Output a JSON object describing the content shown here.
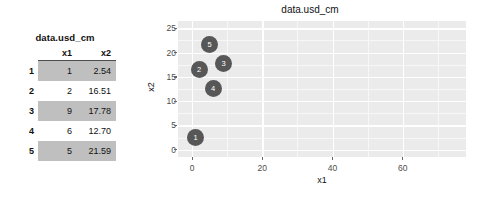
{
  "table": {
    "caption": "data.usd_cm",
    "columns": [
      "x1",
      "x2"
    ],
    "rownames": [
      "1",
      "2",
      "3",
      "4",
      "5"
    ],
    "rows": [
      {
        "name": "1",
        "x1": "1",
        "x2": "2.54",
        "shaded": true
      },
      {
        "name": "2",
        "x1": "2",
        "x2": "16.51",
        "shaded": false
      },
      {
        "name": "3",
        "x1": "9",
        "x2": "17.78",
        "shaded": true
      },
      {
        "name": "4",
        "x1": "6",
        "x2": "12.70",
        "shaded": false
      },
      {
        "name": "5",
        "x1": "5",
        "x2": "21.59",
        "shaded": true
      }
    ]
  },
  "plot": {
    "title": "data.usd_cm",
    "xlabel": "x1",
    "ylabel": "x2"
  },
  "chart_data": {
    "type": "scatter",
    "title": "data.usd_cm",
    "xlabel": "x1",
    "ylabel": "x2",
    "x": [
      1,
      2,
      9,
      6,
      5
    ],
    "y": [
      2.54,
      16.51,
      17.78,
      12.7,
      21.59
    ],
    "point_labels": [
      "1",
      "2",
      "3",
      "4",
      "5"
    ],
    "xlim": [
      -4,
      78
    ],
    "ylim": [
      -1.5,
      26.5
    ],
    "xticks": [
      0,
      20,
      40,
      60
    ],
    "yticks": [
      0,
      5,
      10,
      15,
      20,
      25
    ],
    "xtick_labels": [
      "0",
      "20",
      "40",
      "60"
    ],
    "ytick_labels": [
      "0",
      "5",
      "10",
      "15",
      "20",
      "25"
    ],
    "grid": true,
    "legend": "none",
    "point_color": "#575757",
    "panel_background": "#ebebeb",
    "gridline_color": "#ffffff"
  },
  "colors": {
    "panel_bg": "#ebebeb",
    "gridline": "#ffffff",
    "point": "#575757",
    "table_shade": "#bfbfbf",
    "text": "#111111"
  }
}
